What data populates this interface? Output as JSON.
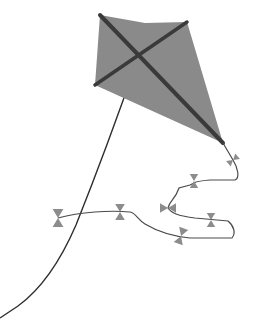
{
  "scene": {
    "title": "Kite illustration",
    "description": "A gray diamond kite with dark cross spars, a long flying string, and a wavy tail decorated with bow ties"
  },
  "colors": {
    "background": "#ffffff",
    "kite_sail": "#8a8a8a",
    "spar": "#3a3a3a",
    "string": "#2e2e2e",
    "tail_line": "#4a4a4a",
    "bow": "#8c8c8c"
  },
  "kite": {
    "sail_points": "100,15 145,23 187,22 223,143 95,85",
    "spar_long": {
      "x1": 100,
      "y1": 15,
      "x2": 223,
      "y2": 143
    },
    "spar_cross": {
      "x1": 95,
      "y1": 85,
      "x2": 187,
      "y2": 22
    }
  },
  "string": {
    "path": "M138,58 C120,110 98,170 76,225 C60,262 40,290 18,306 L0,318"
  },
  "tail": {
    "path": "M223,143 L233,160 C238,168 240,178 235,180 L210,180 C198,181 195,182 194,183 L190,185 L179,188 C175,200 170,200 168,208 C172,214 180,216 195,218 L228,221 C234,226 236,233 232,238 L220,238 L190,238 C170,236 155,230 145,224 C138,220 136,213 130,212 C110,210 80,212 58,218"
  },
  "bows": [
    {
      "x": 233,
      "y": 160,
      "rot": 50,
      "size": 6
    },
    {
      "x": 194,
      "y": 181,
      "rot": 0,
      "size": 7
    },
    {
      "x": 168,
      "y": 208,
      "rot": 90,
      "size": 8
    },
    {
      "x": 211,
      "y": 220,
      "rot": 0,
      "size": 7
    },
    {
      "x": 181,
      "y": 236,
      "rot": 20,
      "size": 8
    },
    {
      "x": 120,
      "y": 212,
      "rot": 0,
      "size": 8
    },
    {
      "x": 58,
      "y": 218,
      "rot": 0,
      "size": 9
    }
  ]
}
